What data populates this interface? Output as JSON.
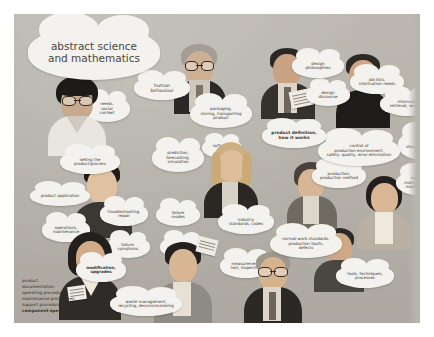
{
  "poster": {
    "title": "abstract science and mathematics",
    "background_color": "#b9b5ad",
    "cloud_color": "#f4f2ee",
    "text_color": "#3a3631"
  },
  "clouds": [
    {
      "id": "abstract-science",
      "text": "abstract science\nand mathematics"
    },
    {
      "id": "human-behaviour",
      "text": "human\nbehaviour"
    },
    {
      "id": "needs-social-context",
      "text": "needs,\nsocial\ncontext"
    },
    {
      "id": "packaging-storing",
      "text": "packaging,\nstoring, transporting\nproduct"
    },
    {
      "id": "design-philosophies",
      "text": "design\nphilosophies"
    },
    {
      "id": "design-discourse",
      "text": "design\ndiscourse"
    },
    {
      "id": "job-lists",
      "text": "job lists,\ninformation needs"
    },
    {
      "id": "information-retrieval",
      "text": "information\nretrieval, searching"
    },
    {
      "id": "product-definition",
      "text": "product definition,\nhow it works"
    },
    {
      "id": "selling-product",
      "text": "selling the\nproduct/process"
    },
    {
      "id": "software-tools",
      "text": "software,\ntools"
    },
    {
      "id": "prediction-forecasting",
      "text": "prediction,\nforecasting,\nsimulation"
    },
    {
      "id": "control-production",
      "text": "control of\nproduction environment,\nsafety, quality, error elimination"
    },
    {
      "id": "logistics-storage",
      "text": "logistics,\nprocess\nstorage, transport\ninventory"
    },
    {
      "id": "product-application",
      "text": "product application"
    },
    {
      "id": "production-method",
      "text": "production,\nproduction method"
    },
    {
      "id": "components-material",
      "text": "components,\nmaterial properties,\nmodels (separate)"
    },
    {
      "id": "operations-maintenance",
      "text": "operations,\nmaintenance"
    },
    {
      "id": "troubleshooting",
      "text": "troubleshooting,\nrepair"
    },
    {
      "id": "failure-modes",
      "text": "failure\nmodes"
    },
    {
      "id": "industry-standards",
      "text": "industry\nstandards, codes"
    },
    {
      "id": "failure-symptoms",
      "text": "failure,\nsymptoms"
    },
    {
      "id": "codes-standards",
      "text": "codes,\nstandards"
    },
    {
      "id": "measurement-test",
      "text": "measurement,\ntest, inspection"
    },
    {
      "id": "normal-work-standards",
      "text": "normal work standards,\nproduction faults,\ndefects"
    },
    {
      "id": "modification-upgrades",
      "text": "modification,\nupgrades"
    },
    {
      "id": "tools-techniques",
      "text": "tools, techniques,\nprocesses"
    },
    {
      "id": "waste-management",
      "text": "waste management,\nrecycling, decommissioning"
    }
  ],
  "documentation_list": {
    "lines": [
      "product",
      "documentation:",
      "operating procedures,",
      "maintenance procedures,",
      "support procedures,",
      "component specifications"
    ],
    "emphasis_line": "component specifications"
  }
}
